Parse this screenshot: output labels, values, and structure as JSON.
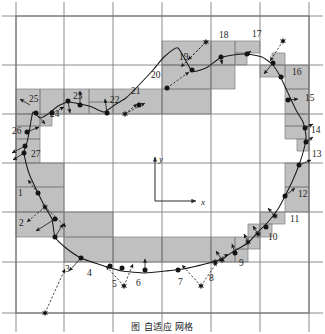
{
  "figure": {
    "title_caption": "图  自适应   网格",
    "axes": {
      "x_label": "x",
      "y_label": "y",
      "origin": {
        "x": 155,
        "y": 201
      },
      "x_arrow_end": {
        "x": 196,
        "y": 201
      },
      "y_arrow_end": {
        "x": 155,
        "y": 157
      }
    },
    "style": {
      "grid_line_color": "#808080",
      "shaded_cell_color": "#c0c0c0",
      "curve_color": "#1a1a1a",
      "marker_color": "#141414",
      "vector_color": "#141414",
      "label_color": "#1a1a1a",
      "background": "#ffffff",
      "border_color": "#6e6e6e"
    },
    "domain_border": {
      "x": 16,
      "y": 16,
      "width": 293,
      "height": 297
    },
    "grid_lines_vertical_x": [
      16,
      64,
      113,
      162,
      211,
      260,
      309
    ],
    "grid_lines_horizontal_y": [
      16,
      65,
      114,
      163,
      212,
      262,
      313
    ],
    "point_labels": [
      {
        "id": "1",
        "x": 18,
        "y": 196
      },
      {
        "id": "2",
        "x": 19,
        "y": 226
      },
      {
        "id": "3",
        "x": 65,
        "y": 272
      },
      {
        "id": "4",
        "x": 87,
        "y": 276
      },
      {
        "id": "5",
        "x": 112,
        "y": 287
      },
      {
        "id": "6",
        "x": 136,
        "y": 286
      },
      {
        "id": "7",
        "x": 178,
        "y": 285
      },
      {
        "id": "8",
        "x": 209,
        "y": 281
      },
      {
        "id": "9",
        "x": 239,
        "y": 266
      },
      {
        "id": "10",
        "x": 268,
        "y": 240
      },
      {
        "id": "11",
        "x": 290,
        "y": 222
      },
      {
        "id": "12",
        "x": 298,
        "y": 197
      },
      {
        "id": "13",
        "x": 312,
        "y": 157
      },
      {
        "id": "14",
        "x": 311,
        "y": 133
      },
      {
        "id": "15",
        "x": 305,
        "y": 101
      },
      {
        "id": "16",
        "x": 292,
        "y": 75
      },
      {
        "id": "17",
        "x": 252,
        "y": 37
      },
      {
        "id": "18",
        "x": 219,
        "y": 38
      },
      {
        "id": "19",
        "x": 179,
        "y": 60
      },
      {
        "id": "20",
        "x": 151,
        "y": 78
      },
      {
        "id": "21",
        "x": 131,
        "y": 94
      },
      {
        "id": "22",
        "x": 110,
        "y": 103
      },
      {
        "id": "23",
        "x": 73,
        "y": 99
      },
      {
        "id": "24",
        "x": 50,
        "y": 117
      },
      {
        "id": "25",
        "x": 29,
        "y": 102
      },
      {
        "id": "26",
        "x": 12,
        "y": 134
      },
      {
        "id": "27",
        "x": 31,
        "y": 157
      }
    ],
    "shaded_cells": [
      {
        "x": 16,
        "y": 89,
        "w": 24,
        "h": 25
      },
      {
        "x": 40,
        "y": 89,
        "w": 24,
        "h": 25
      },
      {
        "x": 64,
        "y": 89,
        "w": 25,
        "h": 25
      },
      {
        "x": 89,
        "y": 89,
        "w": 24,
        "h": 13
      },
      {
        "x": 89,
        "y": 102,
        "w": 24,
        "h": 12
      },
      {
        "x": 113,
        "y": 89,
        "w": 49,
        "h": 25
      },
      {
        "x": 162,
        "y": 89,
        "w": 49,
        "h": 25
      },
      {
        "x": 16,
        "y": 114,
        "w": 24,
        "h": 12
      },
      {
        "x": 16,
        "y": 126,
        "w": 24,
        "h": 13
      },
      {
        "x": 40,
        "y": 114,
        "w": 12,
        "h": 12
      },
      {
        "x": 16,
        "y": 139,
        "w": 24,
        "h": 24
      },
      {
        "x": 16,
        "y": 163,
        "w": 48,
        "h": 24
      },
      {
        "x": 16,
        "y": 187,
        "w": 48,
        "h": 25
      },
      {
        "x": 16,
        "y": 212,
        "w": 48,
        "h": 25
      },
      {
        "x": 64,
        "y": 212,
        "w": 49,
        "h": 25
      },
      {
        "x": 64,
        "y": 237,
        "w": 49,
        "h": 25
      },
      {
        "x": 113,
        "y": 237,
        "w": 49,
        "h": 25
      },
      {
        "x": 162,
        "y": 237,
        "w": 49,
        "h": 25
      },
      {
        "x": 211,
        "y": 237,
        "w": 24,
        "h": 25
      },
      {
        "x": 235,
        "y": 237,
        "w": 13,
        "h": 12
      },
      {
        "x": 235,
        "y": 249,
        "w": 13,
        "h": 13
      },
      {
        "x": 248,
        "y": 237,
        "w": 12,
        "h": 12
      },
      {
        "x": 248,
        "y": 224,
        "w": 12,
        "h": 13
      },
      {
        "x": 260,
        "y": 212,
        "w": 25,
        "h": 12
      },
      {
        "x": 260,
        "y": 224,
        "w": 12,
        "h": 13
      },
      {
        "x": 285,
        "y": 187,
        "w": 24,
        "h": 25
      },
      {
        "x": 285,
        "y": 163,
        "w": 24,
        "h": 24
      },
      {
        "x": 297,
        "y": 139,
        "w": 12,
        "h": 12
      },
      {
        "x": 285,
        "y": 126,
        "w": 24,
        "h": 13
      },
      {
        "x": 285,
        "y": 114,
        "w": 24,
        "h": 12
      },
      {
        "x": 285,
        "y": 89,
        "w": 24,
        "h": 25
      },
      {
        "x": 285,
        "y": 65,
        "w": 24,
        "h": 24
      },
      {
        "x": 260,
        "y": 65,
        "w": 25,
        "h": 12
      },
      {
        "x": 272,
        "y": 53,
        "w": 13,
        "h": 12
      },
      {
        "x": 235,
        "y": 41,
        "w": 25,
        "h": 12
      },
      {
        "x": 235,
        "y": 53,
        "w": 12,
        "h": 12
      },
      {
        "x": 162,
        "y": 41,
        "w": 49,
        "h": 24
      },
      {
        "x": 211,
        "y": 41,
        "w": 24,
        "h": 24
      },
      {
        "x": 162,
        "y": 65,
        "w": 49,
        "h": 24
      },
      {
        "x": 211,
        "y": 65,
        "w": 24,
        "h": 24
      }
    ],
    "curve_points": [
      {
        "x": 38,
        "y": 193
      },
      {
        "x": 45,
        "y": 207
      },
      {
        "x": 52,
        "y": 219
      },
      {
        "x": 55,
        "y": 237
      },
      {
        "x": 66,
        "y": 248
      },
      {
        "x": 81,
        "y": 258
      },
      {
        "x": 104,
        "y": 266
      },
      {
        "x": 122,
        "y": 271
      },
      {
        "x": 145,
        "y": 273
      },
      {
        "x": 166,
        "y": 271
      },
      {
        "x": 183,
        "y": 269
      },
      {
        "x": 205,
        "y": 264
      },
      {
        "x": 222,
        "y": 259
      },
      {
        "x": 234,
        "y": 251
      },
      {
        "x": 248,
        "y": 243
      },
      {
        "x": 258,
        "y": 232
      },
      {
        "x": 268,
        "y": 222
      },
      {
        "x": 278,
        "y": 209
      },
      {
        "x": 285,
        "y": 196
      },
      {
        "x": 292,
        "y": 182
      },
      {
        "x": 299,
        "y": 165
      },
      {
        "x": 304,
        "y": 149
      },
      {
        "x": 306,
        "y": 136
      },
      {
        "x": 303,
        "y": 122
      },
      {
        "x": 296,
        "y": 110
      },
      {
        "x": 288,
        "y": 93
      },
      {
        "x": 280,
        "y": 76
      },
      {
        "x": 272,
        "y": 64
      },
      {
        "x": 262,
        "y": 57
      },
      {
        "x": 247,
        "y": 54
      },
      {
        "x": 233,
        "y": 55
      },
      {
        "x": 220,
        "y": 58
      },
      {
        "x": 206,
        "y": 68
      },
      {
        "x": 192,
        "y": 71
      },
      {
        "x": 178,
        "y": 48
      },
      {
        "x": 164,
        "y": 57
      },
      {
        "x": 153,
        "y": 70
      },
      {
        "x": 139,
        "y": 85
      },
      {
        "x": 126,
        "y": 98
      },
      {
        "x": 116,
        "y": 104
      },
      {
        "x": 104,
        "y": 112
      },
      {
        "x": 92,
        "y": 107
      },
      {
        "x": 80,
        "y": 104
      },
      {
        "x": 68,
        "y": 102
      },
      {
        "x": 58,
        "y": 106
      },
      {
        "x": 48,
        "y": 114
      },
      {
        "x": 40,
        "y": 118
      },
      {
        "x": 33,
        "y": 112
      },
      {
        "x": 30,
        "y": 127
      },
      {
        "x": 28,
        "y": 138
      },
      {
        "x": 26,
        "y": 146
      },
      {
        "x": 24,
        "y": 152
      },
      {
        "x": 26,
        "y": 163
      },
      {
        "x": 30,
        "y": 176
      }
    ],
    "node_markers": [
      {
        "x": 38,
        "y": 193,
        "kind": "dot"
      },
      {
        "x": 45,
        "y": 207,
        "kind": "star"
      },
      {
        "x": 55,
        "y": 219,
        "kind": "dot"
      },
      {
        "x": 55,
        "y": 237,
        "kind": "dot"
      },
      {
        "x": 81,
        "y": 258,
        "kind": "dot"
      },
      {
        "x": 110,
        "y": 266,
        "kind": "dot"
      },
      {
        "x": 122,
        "y": 268,
        "kind": "dot"
      },
      {
        "x": 145,
        "y": 270,
        "kind": "dot"
      },
      {
        "x": 178,
        "y": 270,
        "kind": "dot"
      },
      {
        "x": 222,
        "y": 260,
        "kind": "star"
      },
      {
        "x": 235,
        "y": 253,
        "kind": "dot"
      },
      {
        "x": 248,
        "y": 242,
        "kind": "star"
      },
      {
        "x": 258,
        "y": 234,
        "kind": "star"
      },
      {
        "x": 266,
        "y": 227,
        "kind": "dot"
      },
      {
        "x": 275,
        "y": 216,
        "kind": "star"
      },
      {
        "x": 285,
        "y": 196,
        "kind": "dot"
      },
      {
        "x": 299,
        "y": 165,
        "kind": "dot"
      },
      {
        "x": 306,
        "y": 142,
        "kind": "dot"
      },
      {
        "x": 305,
        "y": 128,
        "kind": "dot"
      },
      {
        "x": 288,
        "y": 100,
        "kind": "dot"
      },
      {
        "x": 281,
        "y": 77,
        "kind": "dot"
      },
      {
        "x": 273,
        "y": 63,
        "kind": "dot"
      },
      {
        "x": 247,
        "y": 54,
        "kind": "dot"
      },
      {
        "x": 221,
        "y": 57,
        "kind": "dot"
      },
      {
        "x": 206,
        "y": 42,
        "kind": "star"
      },
      {
        "x": 192,
        "y": 70,
        "kind": "dot"
      },
      {
        "x": 167,
        "y": 88,
        "kind": "dot"
      },
      {
        "x": 139,
        "y": 105,
        "kind": "dot"
      },
      {
        "x": 125,
        "y": 114,
        "kind": "star"
      },
      {
        "x": 107,
        "y": 113,
        "kind": "dot"
      },
      {
        "x": 80,
        "y": 105,
        "kind": "dot"
      },
      {
        "x": 68,
        "y": 101,
        "kind": "dot"
      },
      {
        "x": 52,
        "y": 113,
        "kind": "dot"
      },
      {
        "x": 36,
        "y": 113,
        "kind": "dot"
      },
      {
        "x": 27,
        "y": 132,
        "kind": "dot"
      },
      {
        "x": 25,
        "y": 146,
        "kind": "dot"
      },
      {
        "x": 24,
        "y": 153,
        "kind": "dot"
      },
      {
        "x": 283,
        "y": 41,
        "kind": "star"
      },
      {
        "x": 45,
        "y": 313,
        "kind": "star"
      },
      {
        "x": 124,
        "y": 286,
        "kind": "star"
      },
      {
        "x": 201,
        "y": 286,
        "kind": "star"
      },
      {
        "x": 215,
        "y": 262,
        "kind": "star"
      }
    ],
    "vectors": [
      {
        "x1": 38,
        "y1": 193,
        "x2": 28,
        "y2": 180,
        "dashed": true
      },
      {
        "x1": 45,
        "y1": 207,
        "x2": 27,
        "y2": 222,
        "dashed": true
      },
      {
        "x1": 55,
        "y1": 219,
        "x2": 36,
        "y2": 231,
        "dashed": false
      },
      {
        "x1": 45,
        "y1": 207,
        "x2": 66,
        "y2": 227,
        "dashed": true
      },
      {
        "x1": 55,
        "y1": 237,
        "x2": 63,
        "y2": 224,
        "dashed": false
      },
      {
        "x1": 45,
        "y1": 313,
        "x2": 65,
        "y2": 269,
        "dashed": true
      },
      {
        "x1": 81,
        "y1": 258,
        "x2": 69,
        "y2": 271,
        "dashed": false
      },
      {
        "x1": 124,
        "y1": 286,
        "x2": 106,
        "y2": 266,
        "dashed": true
      },
      {
        "x1": 124,
        "y1": 286,
        "x2": 133,
        "y2": 264,
        "dashed": true
      },
      {
        "x1": 145,
        "y1": 270,
        "x2": 145,
        "y2": 259,
        "dashed": false
      },
      {
        "x1": 201,
        "y1": 286,
        "x2": 182,
        "y2": 265,
        "dashed": true
      },
      {
        "x1": 201,
        "y1": 286,
        "x2": 217,
        "y2": 262,
        "dashed": true
      },
      {
        "x1": 222,
        "y1": 260,
        "x2": 216,
        "y2": 251,
        "dashed": false
      },
      {
        "x1": 235,
        "y1": 253,
        "x2": 232,
        "y2": 244,
        "dashed": false
      },
      {
        "x1": 248,
        "y1": 242,
        "x2": 244,
        "y2": 234,
        "dashed": false
      },
      {
        "x1": 258,
        "y1": 234,
        "x2": 253,
        "y2": 226,
        "dashed": false
      },
      {
        "x1": 275,
        "y1": 216,
        "x2": 268,
        "y2": 208,
        "dashed": false
      },
      {
        "x1": 285,
        "y1": 196,
        "x2": 295,
        "y2": 188,
        "dashed": false
      },
      {
        "x1": 306,
        "y1": 142,
        "x2": 313,
        "y2": 137,
        "dashed": false
      },
      {
        "x1": 305,
        "y1": 128,
        "x2": 313,
        "y2": 124,
        "dashed": false
      },
      {
        "x1": 299,
        "y1": 165,
        "x2": 311,
        "y2": 160,
        "dashed": false
      },
      {
        "x1": 288,
        "y1": 100,
        "x2": 298,
        "y2": 99,
        "dashed": false
      },
      {
        "x1": 283,
        "y1": 41,
        "x2": 270,
        "y2": 61,
        "dashed": true
      },
      {
        "x1": 273,
        "y1": 63,
        "x2": 264,
        "y2": 74,
        "dashed": false
      },
      {
        "x1": 247,
        "y1": 54,
        "x2": 251,
        "y2": 51,
        "dashed": false
      },
      {
        "x1": 221,
        "y1": 57,
        "x2": 222,
        "y2": 64,
        "dashed": false
      },
      {
        "x1": 206,
        "y1": 42,
        "x2": 188,
        "y2": 60,
        "dashed": true
      },
      {
        "x1": 206,
        "y1": 42,
        "x2": 181,
        "y2": 67,
        "dashed": true
      },
      {
        "x1": 167,
        "y1": 88,
        "x2": 189,
        "y2": 72,
        "dashed": true
      },
      {
        "x1": 125,
        "y1": 114,
        "x2": 145,
        "y2": 103,
        "dashed": true
      },
      {
        "x1": 125,
        "y1": 114,
        "x2": 137,
        "y2": 104,
        "dashed": true
      },
      {
        "x1": 107,
        "y1": 113,
        "x2": 105,
        "y2": 99,
        "dashed": false
      },
      {
        "x1": 80,
        "y1": 105,
        "x2": 80,
        "y2": 91,
        "dashed": false
      },
      {
        "x1": 68,
        "y1": 101,
        "x2": 70,
        "y2": 113,
        "dashed": false
      },
      {
        "x1": 52,
        "y1": 113,
        "x2": 64,
        "y2": 107,
        "dashed": true
      },
      {
        "x1": 36,
        "y1": 113,
        "x2": 45,
        "y2": 124,
        "dashed": true
      },
      {
        "x1": 27,
        "y1": 132,
        "x2": 39,
        "y2": 127,
        "dashed": false
      },
      {
        "x1": 25,
        "y1": 146,
        "x2": 12,
        "y2": 153,
        "dashed": false
      },
      {
        "x1": 24,
        "y1": 153,
        "x2": 13,
        "y2": 160,
        "dashed": false
      },
      {
        "x1": 215,
        "y1": 262,
        "x2": 228,
        "y2": 254,
        "dashed": true
      },
      {
        "x1": 30,
        "y1": 105,
        "x2": 20,
        "y2": 99,
        "dashed": false
      }
    ]
  }
}
